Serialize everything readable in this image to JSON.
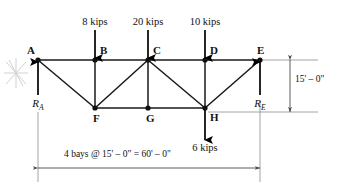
{
  "figure": {
    "type": "structural-truss-diagram",
    "colors": {
      "member": "#1a1a1a",
      "load_arrow": "#000000",
      "dimension": "#4a4a4a",
      "background": "#ffffff",
      "scribble": "#c9c9c9"
    }
  },
  "joints": [
    {
      "id": "A",
      "label": "A",
      "x": 38,
      "y": 60,
      "chord": "top",
      "label_dx": -11,
      "label_dy": -15
    },
    {
      "id": "B",
      "label": "B",
      "x": 95,
      "y": 60,
      "chord": "top",
      "label_dx": 5,
      "label_dy": -15
    },
    {
      "id": "C",
      "label": "C",
      "x": 148,
      "y": 60,
      "chord": "top",
      "label_dx": 5,
      "label_dy": -15
    },
    {
      "id": "D",
      "label": "D",
      "x": 205,
      "y": 60,
      "chord": "top",
      "label_dx": 5,
      "label_dy": -15
    },
    {
      "id": "E",
      "label": "E",
      "x": 260,
      "y": 60,
      "chord": "top",
      "label_dx": -3,
      "label_dy": -15
    },
    {
      "id": "F",
      "label": "F",
      "x": 95,
      "y": 108,
      "chord": "bottom",
      "label_dx": -2,
      "label_dy": 5
    },
    {
      "id": "G",
      "label": "G",
      "x": 148,
      "y": 108,
      "chord": "bottom",
      "label_dx": -2,
      "label_dy": 5
    },
    {
      "id": "H",
      "label": "H",
      "x": 205,
      "y": 108,
      "chord": "bottom",
      "label_dx": 5,
      "label_dy": 4
    }
  ],
  "members": [
    {
      "from": "A",
      "to": "B",
      "kind": "top-chord"
    },
    {
      "from": "B",
      "to": "C",
      "kind": "top-chord"
    },
    {
      "from": "C",
      "to": "D",
      "kind": "top-chord"
    },
    {
      "from": "D",
      "to": "E",
      "kind": "top-chord"
    },
    {
      "from": "F",
      "to": "G",
      "kind": "bottom-chord"
    },
    {
      "from": "G",
      "to": "H",
      "kind": "bottom-chord"
    },
    {
      "from": "B",
      "to": "F",
      "kind": "vertical"
    },
    {
      "from": "C",
      "to": "G",
      "kind": "vertical"
    },
    {
      "from": "D",
      "to": "H",
      "kind": "vertical"
    },
    {
      "from": "A",
      "to": "F",
      "kind": "diagonal"
    },
    {
      "from": "F",
      "to": "C",
      "kind": "diagonal"
    },
    {
      "from": "C",
      "to": "H",
      "kind": "diagonal"
    },
    {
      "from": "H",
      "to": "E",
      "kind": "diagonal"
    }
  ],
  "loads": [
    {
      "id": "load-b",
      "label": "8 kips",
      "joint": "B",
      "magnitude": 8,
      "unit": "kips",
      "direction": "down",
      "x": 95,
      "tip_y": 58,
      "tail_y": 30,
      "label_x": 95,
      "label_y": 17
    },
    {
      "id": "load-c",
      "label": "20 kips",
      "joint": "C",
      "magnitude": 20,
      "unit": "kips",
      "direction": "down",
      "x": 148,
      "tip_y": 58,
      "tail_y": 30,
      "label_x": 148,
      "label_y": 17
    },
    {
      "id": "load-d",
      "label": "10 kips",
      "joint": "D",
      "magnitude": 10,
      "unit": "kips",
      "direction": "down",
      "x": 205,
      "tip_y": 58,
      "tail_y": 30,
      "label_x": 205,
      "label_y": 17
    },
    {
      "id": "load-h",
      "label": "6 kips",
      "joint": "H",
      "magnitude": 6,
      "unit": "kips",
      "direction": "down",
      "x": 205,
      "tip_y": 140,
      "tail_y": 110,
      "label_x": 205,
      "label_y": 143
    }
  ],
  "reactions": [
    {
      "id": "reaction-a",
      "symbol": "R",
      "subscript": "A",
      "joint": "A",
      "direction": "up",
      "x": 38,
      "tip_y": 62,
      "tail_y": 95,
      "label_x": 38,
      "label_y": 98
    },
    {
      "id": "reaction-e",
      "symbol": "R",
      "subscript": "E",
      "joint": "E",
      "direction": "up",
      "x": 260,
      "tip_y": 62,
      "tail_y": 95,
      "label_x": 260,
      "label_y": 98
    }
  ],
  "dimensions": {
    "height": {
      "id": "height-dimension",
      "label": "15' – 0\"",
      "value": "15' - 0\"",
      "orientation": "vertical",
      "x": 290,
      "top_y": 60,
      "bottom_y": 112,
      "label_x": 295,
      "label_y": 80
    },
    "span": {
      "id": "span-dimension",
      "label": "4 bays @ 15' – 0\"  =  60' – 0\"",
      "bays": 4,
      "bay_length": "15' - 0\"",
      "total_length": "60' - 0\"",
      "orientation": "horizontal",
      "y": 168,
      "left_x": 38,
      "right_x": 260,
      "label_x": 149,
      "label_y": 155
    }
  },
  "annotations": [
    {
      "id": "support-scribble",
      "type": "hand-scribble",
      "x": 16,
      "y": 72
    }
  ]
}
